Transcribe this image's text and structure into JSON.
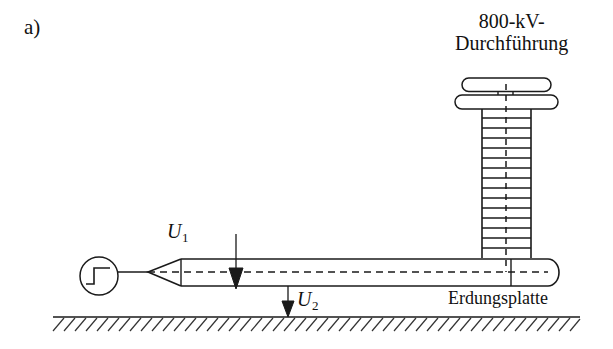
{
  "figure": {
    "panel_label": "a)",
    "background_color": "#ffffff",
    "line_color": "#1a1a1a",
    "caption_font_color": "#111111"
  },
  "labels": {
    "bushing_line1": "800-kV-",
    "bushing_line2": "Durchführung",
    "ground_plate": "Erdungsplatte",
    "voltage_1_symbol": "U",
    "voltage_1_subscript": "1",
    "voltage_2_symbol": "U",
    "voltage_2_subscript": "2"
  },
  "components": {
    "step_source": {
      "name": "step-function-source",
      "center_x": 99,
      "center_y": 276,
      "radius": 19
    },
    "cone_tip": {
      "tip_x": 148,
      "tip_y": 272,
      "base_x": 181
    },
    "cylinder_body": {
      "left_x": 181,
      "right_x": 548,
      "top_y": 259,
      "bottom_y": 286
    },
    "bushing_column": {
      "left_x": 482,
      "right_x": 531,
      "top_y": 108,
      "bottom_y": 258,
      "rib_count": 14
    },
    "bushing_sheds": [
      {
        "left_x": 462,
        "right_x": 551,
        "top_y": 78,
        "bottom_y": 91
      },
      {
        "left_x": 455,
        "right_x": 558,
        "top_y": 95,
        "bottom_y": 109
      }
    ],
    "ground_line": {
      "left_x": 53,
      "right_x": 580,
      "y": 317,
      "hatch_count": 46
    },
    "arrow_u1": {
      "x": 236,
      "top_y": 234,
      "tip_y": 288
    },
    "arrow_u2": {
      "x": 288,
      "top_y": 286,
      "tip_y": 317
    }
  }
}
